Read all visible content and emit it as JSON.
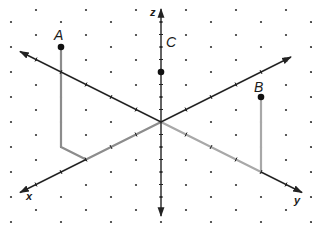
{
  "diagram": {
    "grid": {
      "type": "isometric-dots",
      "col_spacing_px": 25,
      "row_spacing_px": 12.5
    },
    "origin_px": [
      161,
      122
    ],
    "unit_vectors_px": {
      "x": [
        -25,
        12.5
      ],
      "y": [
        25,
        12.5
      ],
      "z": [
        0,
        -12.5
      ]
    },
    "axes": {
      "x": {
        "label": "x"
      },
      "y": {
        "label": "y"
      },
      "z": {
        "label": "z"
      }
    },
    "points": {
      "A": {
        "label": "A",
        "coords": [
          3,
          -1,
          8
        ]
      },
      "B": {
        "label": "B",
        "coords": [
          0,
          4,
          6
        ]
      },
      "C": {
        "label": "C",
        "coords": [
          0,
          0,
          4
        ]
      }
    },
    "colors": {
      "axis": "#222222",
      "path": "#8c8c8c",
      "path_light": "#a8a8a8",
      "dot": "#333333",
      "point": "#111111"
    }
  }
}
